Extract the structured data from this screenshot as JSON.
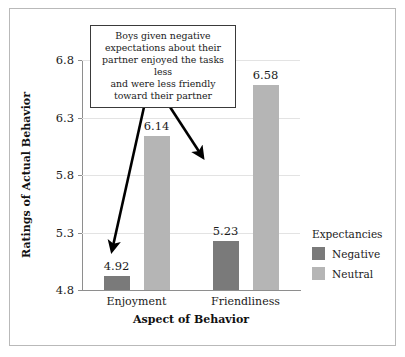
{
  "chart_data": {
    "type": "bar",
    "title": "",
    "xlabel": "Aspect of Behavior",
    "ylabel": "Ratings of Actual Behavior",
    "categories": [
      "Enjoyment",
      "Friendliness"
    ],
    "series": [
      {
        "name": "Negative",
        "values": [
          4.92,
          5.23
        ],
        "color": "#7a7a7a"
      },
      {
        "name": "Neutral",
        "values": [
          6.14,
          6.58
        ],
        "color": "#b5b5b5"
      }
    ],
    "bars": [
      {
        "category": "Enjoyment",
        "series": "Negative",
        "value": 4.92,
        "label": "4.92"
      },
      {
        "category": "Enjoyment",
        "series": "Neutral",
        "value": 5.23,
        "label": "5.23"
      },
      {
        "category": "Friendliness",
        "series": "Negative",
        "value": 6.14,
        "label": "6.14"
      },
      {
        "category": "Friendliness",
        "series": "Neutral",
        "value": 6.58,
        "label": "6.58"
      }
    ],
    "ylim": [
      4.8,
      6.8
    ],
    "ytick_labels": [
      "4.8",
      "5.3",
      "5.8",
      "6.3",
      "6.8"
    ],
    "ytick_values": [
      4.8,
      5.3,
      5.8,
      6.3,
      6.8
    ],
    "grid": true,
    "legend_position": "right"
  },
  "legend": {
    "title": "Expectancies",
    "entries": [
      {
        "label": "Negative",
        "color": "#7a7a7a"
      },
      {
        "label": "Neutral",
        "color": "#b5b5b5"
      }
    ]
  },
  "annotation": {
    "text": "Boys given negative expectations about their partner enjoyed the tasks less and were less friendly toward their partner",
    "lines": [
      "Boys given negative",
      "expectations about their",
      "partner enjoyed the tasks less",
      "and were less friendly",
      "toward their partner"
    ]
  },
  "axis": {
    "y_title": "Ratings of Actual Behavior",
    "x_title": "Aspect of Behavior"
  },
  "colors": {
    "negative": "#7a7a7a",
    "neutral": "#b5b5b5",
    "grid": "#e3e3e3",
    "axis": "#8e8e8e",
    "frame": "#b9b9b9",
    "text": "#1a1a1a",
    "arrow": "#000000"
  }
}
